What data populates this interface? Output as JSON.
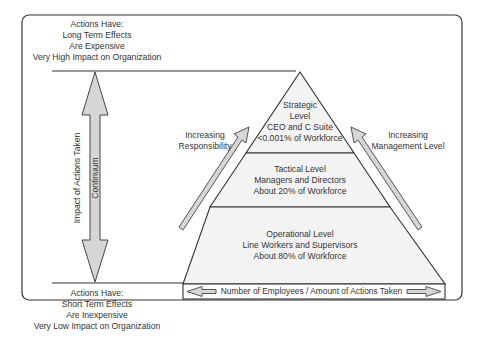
{
  "diagram": {
    "colors": {
      "stroke": "#333333",
      "pyramid_fill": "#f3f3f3",
      "arrow_fill": "#d6d6d6",
      "background": "#ffffff"
    },
    "top_note": {
      "lines": [
        "Actions Have:",
        "Long Term Effects",
        "Are Expensive",
        "Very High Impact on Organization"
      ]
    },
    "bottom_note": {
      "lines": [
        "Actions Have:",
        "Short Term Effects",
        "Are Inexpensive",
        "Very Low Impact on Organization"
      ]
    },
    "vertical_axis": {
      "label": "Impact of Actions Taken",
      "arrow_label": "Continuum"
    },
    "left_arrow": {
      "lines": [
        "Increasing",
        "Responsibility"
      ]
    },
    "right_arrow": {
      "lines": [
        "Increasing",
        "Management Level"
      ]
    },
    "levels": [
      {
        "name": "strategic",
        "lines": [
          "Strategic",
          "Level",
          "CEO and C Suite",
          "<0.001% of Workforce"
        ]
      },
      {
        "name": "tactical",
        "lines": [
          "Tactical Level",
          "Managers and Directors",
          "About 20% of Workforce"
        ]
      },
      {
        "name": "operational",
        "lines": [
          "Operational Level",
          "Line Workers and Supervisors",
          "About 80% of Workforce"
        ]
      }
    ],
    "base_bar": {
      "label": "Number of Employees / Amount of Actions Taken"
    }
  }
}
